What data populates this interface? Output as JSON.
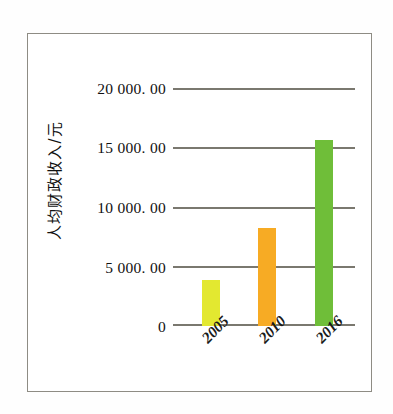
{
  "figure": {
    "name": "per-capita-fiscal-revenue-bar-chart",
    "frame_color": "#8e8c84",
    "background": "#ffffff"
  },
  "chart_data": {
    "type": "bar",
    "title": "",
    "subtitle": "",
    "xlabel": "",
    "ylabel": "人均财政收入/元",
    "categories": [
      "2005",
      "2010",
      "2016"
    ],
    "values": [
      3870,
      8320,
      15800
    ],
    "series": [
      {
        "name": "人均财政收入",
        "values": [
          3870,
          8320,
          15800
        ]
      }
    ],
    "bar_colors": [
      "#e3e830",
      "#f7ab24",
      "#6fbe39"
    ],
    "ylim": [
      0,
      20000
    ],
    "ytick_values": [
      0,
      5000,
      10000,
      15000,
      20000
    ],
    "ytick_labels": [
      "0",
      "5 000. 00",
      "10 000. 00",
      "15 000. 00",
      "20 000. 00"
    ],
    "xtick_labels": [
      "2005",
      "2010",
      "2016"
    ],
    "grid": "horizontal",
    "gridline_color": "#7a786f",
    "legend": "none",
    "legend_position": "none",
    "annotations": []
  },
  "axes": {
    "y_title": "人均财政收入/元",
    "y_ticks": [
      {
        "label": "20 000. 00",
        "value": 20000
      },
      {
        "label": "15 000. 00",
        "value": 15000
      },
      {
        "label": "10 000. 00",
        "value": 10000
      },
      {
        "label": "5 000. 00",
        "value": 5000
      },
      {
        "label": "0",
        "value": 0
      }
    ],
    "x_ticks": [
      {
        "label": "2005"
      },
      {
        "label": "2010"
      },
      {
        "label": "2016"
      }
    ]
  }
}
